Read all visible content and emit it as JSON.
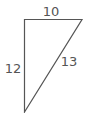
{
  "diagram": {
    "type": "right-triangle",
    "sides": {
      "top": "10",
      "left": "12",
      "hypotenuse": "13"
    },
    "colors": {
      "stroke": "#555555",
      "text": "#555555",
      "background": "#ffffff"
    }
  }
}
